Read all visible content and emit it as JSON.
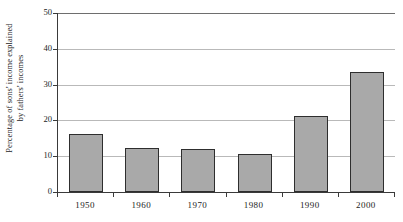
{
  "chart_data": {
    "type": "bar",
    "title": "",
    "subtitle": "",
    "xlabel": "",
    "ylabel": "Percentage of sons' income explained by fathers' incomes",
    "ylabel_lines": [
      "Percentage of sons' income explained",
      "by fathers' incomes"
    ],
    "categories": [
      "1950",
      "1960",
      "1970",
      "1980",
      "1990",
      "2000"
    ],
    "values": [
      16.2,
      12.4,
      12.0,
      10.6,
      21.2,
      33.5
    ],
    "ylim": [
      0,
      50
    ],
    "ytick_values": [
      0,
      10,
      20,
      30,
      40,
      50
    ],
    "ytick_labels": [
      "0",
      "10",
      "20",
      "30",
      "40",
      "50"
    ],
    "grid": true,
    "grid_axis": "y",
    "legend": false,
    "legend_position": "none",
    "bar_fill_color": "#a9a9a9",
    "bar_border_color": "#2e2e2e",
    "gridline_color": "#b9b9b9",
    "axis_color": "#3a3a3a",
    "background_color": "#ffffff"
  }
}
